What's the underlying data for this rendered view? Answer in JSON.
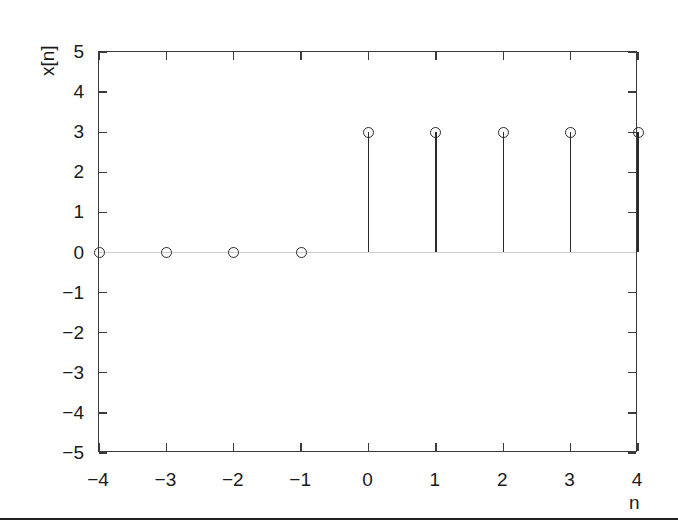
{
  "figure": {
    "background": "#ffffff",
    "frame_color": "#3a3a3a",
    "marker_color": "#2a2a2a",
    "baseline_color": "#cfcfcf",
    "page_rule_color": "#222222",
    "page_rule_y": 518
  },
  "chart_data": {
    "type": "line",
    "plot_style": "stem",
    "title": "",
    "xlabel": "n",
    "ylabel": "x[n]",
    "x": [
      -4,
      -3,
      -2,
      -1,
      0,
      1,
      2,
      3,
      4
    ],
    "values": [
      0,
      0,
      0,
      0,
      3,
      3,
      3,
      3,
      3
    ],
    "xlim": [
      -4,
      4
    ],
    "ylim": [
      -5,
      5
    ],
    "xticks": [
      -4,
      -3,
      -2,
      -1,
      0,
      1,
      2,
      3,
      4
    ],
    "yticks": [
      -5,
      -4,
      -3,
      -2,
      -1,
      0,
      1,
      2,
      3,
      4,
      5
    ],
    "xtick_labels": [
      "-4",
      "-3",
      "-2",
      "-1",
      "0",
      "1",
      "2",
      "3",
      "4"
    ],
    "ytick_labels": [
      "-5",
      "-4",
      "-3",
      "-2",
      "-1",
      "0",
      "1",
      "2",
      "3",
      "4",
      "5"
    ],
    "grid": false,
    "legend": null,
    "baseline": 0,
    "marker": "open-circle",
    "annotations": []
  }
}
